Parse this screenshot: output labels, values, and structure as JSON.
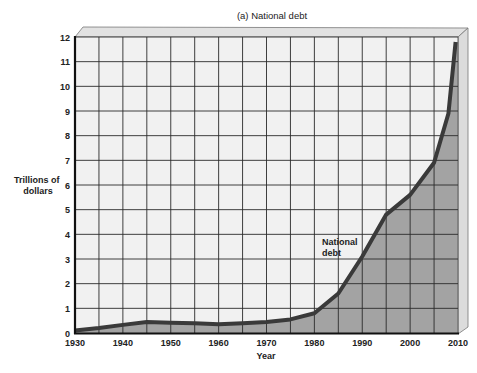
{
  "chart_data": {
    "type": "area",
    "title": "(a) National debt",
    "xlabel": "Year",
    "ylabel": "Trillions of dollars",
    "ylabel_lines": [
      "Trillions of",
      "dollars"
    ],
    "xlim": [
      1930,
      2010
    ],
    "ylim": [
      0,
      12
    ],
    "grid": true,
    "x_ticks": [
      1930,
      1940,
      1950,
      1960,
      1970,
      1980,
      1990,
      2000,
      2010
    ],
    "y_ticks": [
      0,
      1,
      2,
      3,
      4,
      5,
      6,
      7,
      8,
      9,
      10,
      11,
      12
    ],
    "series": [
      {
        "name": "National debt",
        "x": [
          1930,
          1935,
          1940,
          1945,
          1950,
          1955,
          1960,
          1965,
          1970,
          1975,
          1980,
          1985,
          1990,
          1995,
          2000,
          2005,
          2008,
          2009.5
        ],
        "values": [
          0.1,
          0.2,
          0.33,
          0.45,
          0.42,
          0.4,
          0.35,
          0.4,
          0.45,
          0.55,
          0.8,
          1.6,
          3.1,
          4.8,
          5.6,
          6.9,
          8.9,
          11.8
        ]
      }
    ],
    "annotations": [
      {
        "text_lines": [
          "National",
          "debt"
        ],
        "x": 1987,
        "y": 3.6
      }
    ],
    "colors": {
      "fill": "#a3a3a3",
      "line": "#3a3a3a",
      "plot_bg": "#f1f1f1",
      "grid": "#2a2a2a",
      "side_face": "#dcdcdc",
      "top_face": "#e2e2e2"
    }
  }
}
